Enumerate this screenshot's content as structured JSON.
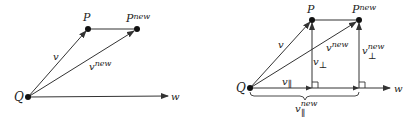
{
  "left_diagram": {
    "labels": {
      "Q": "Q",
      "P": "P",
      "P_new_base": "P",
      "P_new_sup": "new",
      "v": "v",
      "v_new_base": "v",
      "v_new_sup": "new",
      "w": "w"
    }
  },
  "right_diagram": {
    "labels": {
      "Q": "Q",
      "P": "P",
      "P_new_base": "P",
      "P_new_sup": "new",
      "v": "v",
      "v_new_base": "v",
      "v_new_sup": "new",
      "v_perp_base": "v",
      "v_perp_sub": "⊥",
      "v_perp_new_base": "v",
      "v_perp_new_sub": "⊥",
      "v_perp_new_sup": "new",
      "v_par_base": "v",
      "v_par_sub": "∥",
      "v_par_new_base": "v",
      "v_par_new_sub": "∥",
      "v_par_new_sup": "new",
      "w": "w"
    }
  },
  "colors": {
    "stroke": "#333333",
    "point": "#111111"
  }
}
